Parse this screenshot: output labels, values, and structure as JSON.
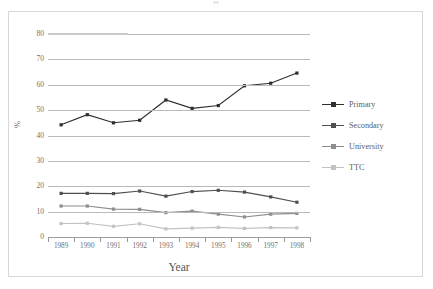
{
  "chart_data": {
    "type": "line",
    "title": "",
    "xlabel": "Year",
    "ylabel": "%",
    "categories": [
      "1989",
      "1990",
      "1991",
      "1992",
      "1993",
      "1994",
      "1995",
      "1996",
      "1997",
      "1998"
    ],
    "ylim": [
      0,
      80
    ],
    "yticks": [
      0,
      10,
      20,
      30,
      40,
      50,
      60,
      70,
      80
    ],
    "ytick_labels": [
      "0",
      "10",
      "20",
      "30",
      "40",
      "50",
      "60",
      "70",
      "80"
    ],
    "grid": true,
    "legend_position": "right",
    "series": [
      {
        "name": "Primary",
        "color": "#2e2e2e",
        "values": [
          44.2,
          48.2,
          45.0,
          46.0,
          54.0,
          50.7,
          51.8,
          59.6,
          60.6,
          64.6
        ]
      },
      {
        "name": "Secondary",
        "color": "#4f4f4f",
        "values": [
          17.2,
          17.2,
          17.1,
          18.1,
          16.1,
          17.9,
          18.4,
          17.7,
          15.8,
          13.7
        ]
      },
      {
        "name": "University",
        "color": "#8d8d8d",
        "values": [
          12.2,
          12.2,
          11.0,
          10.9,
          9.6,
          10.2,
          9.0,
          7.9,
          9.0,
          9.3
        ]
      },
      {
        "name": "TTC",
        "color": "#c2c2c2",
        "values": [
          5.3,
          5.4,
          4.2,
          5.2,
          3.2,
          3.5,
          3.8,
          3.4,
          3.7,
          3.6
        ]
      }
    ]
  },
  "legend": {
    "items": [
      {
        "label": "Primary"
      },
      {
        "label": "Secondary"
      },
      {
        "label": "University"
      },
      {
        "label": "TTC"
      }
    ]
  },
  "colors": {
    "primary": "#2e2e2e",
    "secondary": "#4f4f4f",
    "university": "#8d8d8d",
    "ttc": "#c2c2c2",
    "gridline": "#b9b9b9",
    "axis": "#9a9a9a",
    "border": "#d8d8d8",
    "text": "#6f6f6f"
  }
}
